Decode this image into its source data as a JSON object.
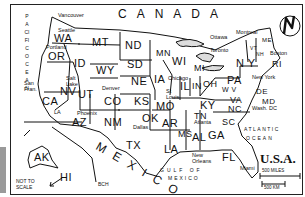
{
  "map": {
    "title": "U.S.A.",
    "neighbors": {
      "north": "CANADA",
      "south": "MEXICO"
    },
    "oceans": {
      "pacific": "PACIFIC OCEAN",
      "atlantic_line1": "ATLANTIC",
      "atlantic_line2": "OCEAN",
      "gulf_line1": "GULF OF",
      "gulf_line2": "MEXICO"
    },
    "states": {
      "WA": "WA",
      "OR": "OR",
      "CA": "CA",
      "ID": "ID",
      "NV": "NV",
      "UT": "UT",
      "AZ": "AZ",
      "MT": "MT",
      "WY": "WY",
      "CO": "CO",
      "NM": "NM",
      "ND": "ND",
      "SD": "SD",
      "NE": "NE",
      "KS": "KS",
      "OK": "OK",
      "TX": "TX",
      "MN": "MN",
      "IA": "IA",
      "MO": "MO",
      "AR": "AR",
      "LA": "LA",
      "WI": "WI",
      "IL": "IL",
      "MI": "MI",
      "IN": "IN",
      "OH": "OH",
      "KY": "KY",
      "TN": "TN",
      "MS": "MS",
      "AL": "AL",
      "GA": "GA",
      "FL": "FL",
      "SC": "SC",
      "NC": "NC",
      "VA": "VA",
      "WV": "W V",
      "PA": "PA",
      "NY": "N Y",
      "VT": "VT",
      "NH": "NH",
      "ME": "ME",
      "RI": "RI",
      "DE": "DE",
      "MD": "MD",
      "AK": "AK",
      "HI": "HI"
    },
    "cities": {
      "vancouver": "Vancouver",
      "seattle": "Seattle",
      "portland": "Portland",
      "san_fran": "San Fran.",
      "la": "LA",
      "salt_lake": "Salt Lake",
      "denver": "Denver",
      "phoenix": "Phoenix",
      "dallas": "Dallas",
      "chicago": "Chicago",
      "st_louis": "St Louis",
      "atlanta": "Atlanta",
      "new_orleans": "New Orleans",
      "miami": "Miami",
      "ottawa": "Ottawa",
      "montreal": "Montreal",
      "toronto": "Toronto",
      "boston": "Boston",
      "new_york": "New York",
      "wash_dc": "Wash. DC"
    },
    "notes": {
      "not_to_scale": "NOT TO SCALE",
      "initials": "BCH"
    },
    "scale": {
      "miles": "500 MILES",
      "km": "500 KM"
    },
    "compass": {
      "letter": "N"
    }
  }
}
